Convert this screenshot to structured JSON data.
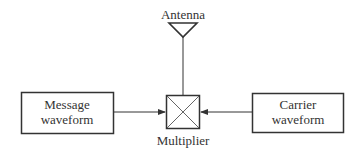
{
  "diagram": {
    "type": "block-diagram",
    "antenna": {
      "label": "Antenna"
    },
    "message_block": {
      "line1": "Message",
      "line2": "waveform"
    },
    "carrier_block": {
      "line1": "Carrier",
      "line2": "waveform"
    },
    "multiplier": {
      "label": "Multiplier",
      "symbol": "crossed-box"
    },
    "connections": [
      {
        "from": "Message waveform",
        "to": "Multiplier",
        "arrow": true
      },
      {
        "from": "Carrier waveform",
        "to": "Multiplier",
        "arrow": true
      },
      {
        "from": "Multiplier",
        "to": "Antenna",
        "arrow": false
      }
    ],
    "colors": {
      "stroke": "#333333",
      "background": "#ffffff"
    }
  }
}
